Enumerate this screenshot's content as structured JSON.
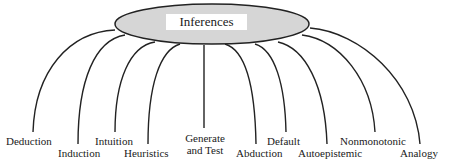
{
  "diagram": {
    "root": {
      "label": "Inferences",
      "fill": "#d6d6d6",
      "stroke": "#222222"
    },
    "children": [
      {
        "id": "deduction",
        "label": "Deduction"
      },
      {
        "id": "induction",
        "label": "Induction"
      },
      {
        "id": "intuition",
        "label": "Intuition"
      },
      {
        "id": "heuristics",
        "label": "Heuristics"
      },
      {
        "id": "generate-and-test",
        "label_line1": "Generate",
        "label_line2": "and Test"
      },
      {
        "id": "abduction",
        "label": "Abduction"
      },
      {
        "id": "default",
        "label": "Default"
      },
      {
        "id": "autoepistemic",
        "label": "Autoepistemic"
      },
      {
        "id": "nonmonotonic",
        "label": "Nonmonotonic"
      },
      {
        "id": "analogy",
        "label": "Analogy"
      }
    ]
  }
}
